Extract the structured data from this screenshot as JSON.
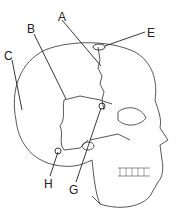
{
  "diagram": {
    "labels": [
      {
        "id": "A",
        "text": "A",
        "x": 58,
        "y": 11
      },
      {
        "id": "B",
        "text": "B",
        "x": 27,
        "y": 23
      },
      {
        "id": "C",
        "text": "C",
        "x": 4,
        "y": 50
      },
      {
        "id": "E",
        "text": "E",
        "x": 147,
        "y": 27
      },
      {
        "id": "G",
        "text": "G",
        "x": 69,
        "y": 184
      },
      {
        "id": "H",
        "text": "H",
        "x": 44,
        "y": 178
      }
    ],
    "colors": {
      "line": "#333333",
      "background": "#ffffff"
    }
  }
}
